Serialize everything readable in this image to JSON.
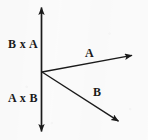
{
  "figure": {
    "background_color": "#fbfbfb",
    "ink_color": "#1a1a1a",
    "labels": {
      "cross_up": "B x A",
      "cross_down": "A x B",
      "vector_a": "A",
      "vector_b": "B"
    },
    "axis": {
      "name": "vertical-axis",
      "double_headed": true,
      "x": 41.5,
      "top_y": 6,
      "bottom_y": 133
    },
    "origin": {
      "x": 42,
      "y": 72
    },
    "vectors": [
      {
        "name": "vector-a",
        "label": "A",
        "from": {
          "x": 42,
          "y": 72
        },
        "to": {
          "x": 134,
          "y": 55
        },
        "label_position": {
          "x": 85,
          "y": 47
        }
      },
      {
        "name": "vector-b",
        "label": "B",
        "from": {
          "x": 42,
          "y": 72
        },
        "to": {
          "x": 121,
          "y": 123
        },
        "label_position": {
          "x": 93,
          "y": 86
        }
      }
    ],
    "label_positions": {
      "cross_up": {
        "x": 8,
        "y": 38
      },
      "cross_down": {
        "x": 8,
        "y": 92
      }
    }
  }
}
